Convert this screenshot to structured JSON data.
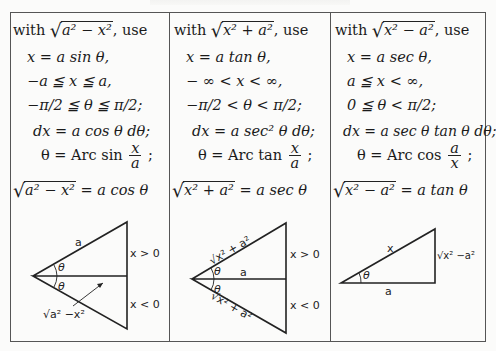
{
  "page": {
    "header_cutoff": ""
  },
  "columns": [
    {
      "intro_prefix": "with",
      "intro_radical": "a² − x²",
      "intro_suffix": ", use",
      "substitution": "x = a sin θ,",
      "x_range": "−a ≦ x ≦ a,",
      "theta_range": "−π/2 ≦ θ ≦ π/2;",
      "differential": "dx = a cos θ dθ;",
      "inverse_lhs": "θ = Arc sin",
      "inverse_num": "x",
      "inverse_den": "a",
      "inverse_suffix": ";",
      "identity_radical": "a² − x²",
      "identity_rhs": "= a cos θ",
      "diagram": {
        "type": "double-triangle",
        "hyp_label": "a",
        "upper_label": "x > 0",
        "lower_label": "x < 0",
        "adjacent_label": "√a² −x²",
        "angle_label": "θ"
      }
    },
    {
      "intro_prefix": "with",
      "intro_radical": "x² + a²",
      "intro_suffix": ", use",
      "substitution": "x = a tan θ,",
      "x_range": "− ∞ < x < ∞,",
      "theta_range": "−π/2 < θ < π/2;",
      "differential": "dx = a sec² θ dθ;",
      "inverse_lhs": "θ = Arc tan",
      "inverse_num": "x",
      "inverse_den": "a",
      "inverse_suffix": ";",
      "identity_radical": "x² + a²",
      "identity_rhs": "= a sec θ",
      "diagram": {
        "type": "double-triangle",
        "hyp_label": "√x² + a²",
        "adjacent_label": "a",
        "upper_label": "x > 0",
        "lower_label": "x < 0",
        "angle_label": "θ"
      }
    },
    {
      "intro_prefix": "with",
      "intro_radical": "x² − a²",
      "intro_suffix": ", use",
      "substitution": "x = a sec θ,",
      "x_range": "a ≦ x < ∞,",
      "theta_range": "0 ≦ θ < π/2;",
      "differential": "dx = a sec θ tan θ dθ;",
      "inverse_lhs": "θ = Arc cos",
      "inverse_num": "a",
      "inverse_den": "x",
      "inverse_suffix": ";",
      "identity_radical": "x² − a²",
      "identity_rhs": "= a tan θ",
      "diagram": {
        "type": "right-triangle",
        "hyp_label": "x",
        "adjacent_label": "a",
        "opposite_label": "√x² −a²",
        "angle_label": "θ"
      }
    }
  ]
}
